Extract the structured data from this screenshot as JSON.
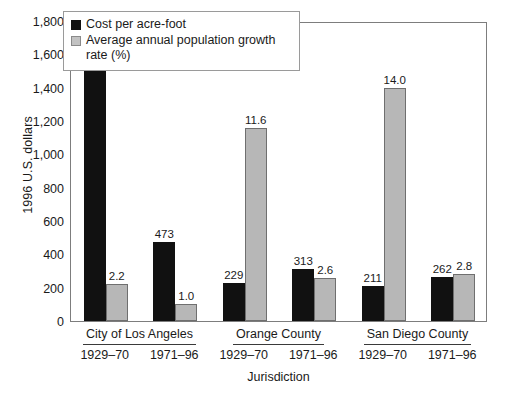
{
  "chart_data": {
    "type": "bar",
    "title": "",
    "xlabel": "Jurisdiction",
    "ylabel": "1996 U.S. dollars",
    "ylim": [
      0,
      1800
    ],
    "ytick_labels": [
      "1,800",
      "1,600",
      "1,400",
      "1,200",
      "1,000",
      "800",
      "600",
      "400",
      "200",
      "0"
    ],
    "ytick_values": [
      1800,
      1600,
      1400,
      1200,
      1000,
      800,
      600,
      400,
      200,
      0
    ],
    "grid": false,
    "legend_position": "top-left-inside",
    "groups": [
      {
        "name": "City of Los Angeles",
        "periods": [
          "1929–70",
          "1971–96"
        ]
      },
      {
        "name": "Orange County",
        "periods": [
          "1929–70",
          "1971–96"
        ]
      },
      {
        "name": "San Diego County",
        "periods": [
          "1929–70",
          "1971–96"
        ]
      }
    ],
    "categories": [
      "City of Los Angeles 1929–70",
      "City of Los Angeles 1971–96",
      "Orange County 1929–70",
      "Orange County 1971–96",
      "San Diego County 1929–70",
      "San Diego County 1971–96"
    ],
    "series": [
      {
        "name": "Cost per acre-foot",
        "color": "#111111",
        "unit": "1996 U.S. dollars",
        "values": [
          1670,
          473,
          229,
          313,
          211,
          262
        ],
        "labels": [
          "1,670",
          "473",
          "229",
          "313",
          "211",
          "262"
        ]
      },
      {
        "name": "Average annual population growth rate (%)",
        "color": "#b7b7b7",
        "unit": "percent",
        "values": [
          2.2,
          1.0,
          11.6,
          2.6,
          14.0,
          2.8
        ],
        "labels": [
          "2.2",
          "1.0",
          "11.6",
          "2.6",
          "14.0",
          "2.8"
        ],
        "plotted_scale_factor": 100
      }
    ]
  },
  "legend": {
    "items": [
      {
        "label": "Cost per acre-foot",
        "swatch": "cost"
      },
      {
        "label": "Average annual population growth rate (%)",
        "swatch": "growth"
      }
    ]
  },
  "axis": {
    "y_title": "1996 U.S. dollars",
    "x_title": "Jurisdiction"
  }
}
